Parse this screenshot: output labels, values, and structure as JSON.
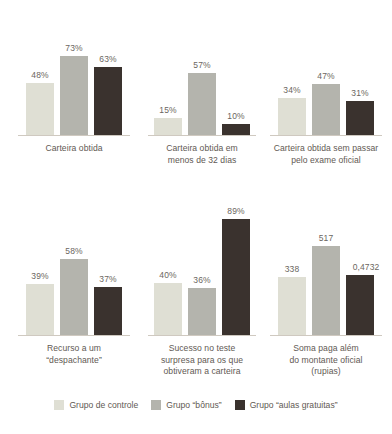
{
  "chart_data": {
    "type": "bar",
    "title": "",
    "subtitle": "",
    "xlabel": "",
    "ylabel": "",
    "grid": false,
    "legend_position": "bottom",
    "legend": [
      {
        "name": "Grupo de controle",
        "color": "#dfdfd4"
      },
      {
        "name": "Grupo “bônus”",
        "color": "#b4b4ad"
      },
      {
        "name": "Grupo “aulas gratuitas”",
        "color": "#3a322e"
      }
    ],
    "series": [
      {
        "name": "Grupo de controle",
        "color": "#dfdfd4"
      },
      {
        "name": "Grupo “bônus”",
        "color": "#b4b4ad"
      },
      {
        "name": "Grupo “aulas gratuitas”",
        "color": "#3a322e"
      }
    ],
    "panels": [
      {
        "row": 0,
        "groups": [
          {
            "category": "Carteira obtida",
            "caption_lines": [
              "Carteira obtida"
            ],
            "unit": "%",
            "values": [
              48,
              73,
              63
            ],
            "labels": [
              "48%",
              "73%",
              "63%"
            ]
          },
          {
            "category": "Carteira obtida em menos de 32 dias",
            "caption_lines": [
              "Carteira obtida em",
              "menos de 32 dias"
            ],
            "unit": "%",
            "values": [
              15,
              57,
              10
            ],
            "labels": [
              "15%",
              "57%",
              "10%"
            ]
          },
          {
            "category": "Carteira obtida sem passar pelo exame oficial",
            "caption_lines": [
              "Carteira obtida sem passar",
              "pelo exame oficial"
            ],
            "unit": "%",
            "values": [
              34,
              47,
              31
            ],
            "labels": [
              "34%",
              "47%",
              "31%"
            ]
          }
        ]
      },
      {
        "row": 1,
        "groups": [
          {
            "category": "Recurso a um “despachante”",
            "caption_lines": [
              "Recurso a um",
              "“despachante”"
            ],
            "unit": "%",
            "values": [
              39,
              58,
              37
            ],
            "labels": [
              "39%",
              "58%",
              "37%"
            ]
          },
          {
            "category": "Sucesso no teste surpresa para os que obtiveram a carteira",
            "caption_lines": [
              "Sucesso no teste",
              "surpresa para os que",
              "obtiveram a carteira"
            ],
            "unit": "%",
            "values": [
              40,
              36,
              89
            ],
            "labels": [
              "40%",
              "36%",
              "89%"
            ]
          },
          {
            "category": "Soma paga além do montante oficial (rupias)",
            "caption_lines": [
              "Soma paga além",
              "do montante oficial",
              "(rupias)"
            ],
            "unit": "rupias",
            "values": [
              338,
              517,
              352
            ],
            "labels": [
              "338",
              "517",
              "0,4732"
            ]
          }
        ]
      }
    ]
  },
  "panels": {
    "top": {
      "groups": [
        {
          "caption_1": "Carteira obtida",
          "caption_2": "",
          "caption_3": "",
          "bars": [
            {
              "label": "48%",
              "height_px": 52
            },
            {
              "label": "73%",
              "height_px": 79
            },
            {
              "label": "63%",
              "height_px": 68
            }
          ]
        },
        {
          "caption_1": "Carteira obtida em",
          "caption_2": "menos de 32 dias",
          "caption_3": "",
          "bars": [
            {
              "label": "15%",
              "height_px": 17
            },
            {
              "label": "57%",
              "height_px": 62
            },
            {
              "label": "10%",
              "height_px": 11
            }
          ]
        },
        {
          "caption_1": "Carteira obtida sem passar",
          "caption_2": "pelo exame oficial",
          "caption_3": "",
          "bars": [
            {
              "label": "34%",
              "height_px": 37
            },
            {
              "label": "47%",
              "height_px": 51
            },
            {
              "label": "31%",
              "height_px": 34
            }
          ]
        }
      ]
    },
    "bottom": {
      "groups": [
        {
          "caption_1": "Recurso a um",
          "caption_2": "“despachante”",
          "caption_3": "",
          "bars": [
            {
              "label": "39%",
              "height_px": 51
            },
            {
              "label": "58%",
              "height_px": 76
            },
            {
              "label": "37%",
              "height_px": 48
            }
          ]
        },
        {
          "caption_1": "Sucesso no teste",
          "caption_2": "surpresa para os que",
          "caption_3": "obtiveram a carteira",
          "bars": [
            {
              "label": "40%",
              "height_px": 52
            },
            {
              "label": "36%",
              "height_px": 47
            },
            {
              "label": "89%",
              "height_px": 116
            }
          ]
        },
        {
          "caption_1": "Soma paga além",
          "caption_2": "do montante oficial",
          "caption_3": "(rupias)",
          "bars": [
            {
              "label": "338",
              "height_px": 58
            },
            {
              "label": "517",
              "height_px": 89
            },
            {
              "label": "0,4732",
              "height_px": 60
            }
          ]
        }
      ]
    }
  },
  "legend": {
    "items": [
      {
        "label": "Grupo de controle",
        "color": "#dfdfd4"
      },
      {
        "label": "Grupo “bônus”",
        "color": "#b4b4ad"
      },
      {
        "label": "Grupo “aulas gratuitas”",
        "color": "#3a322e"
      }
    ]
  }
}
